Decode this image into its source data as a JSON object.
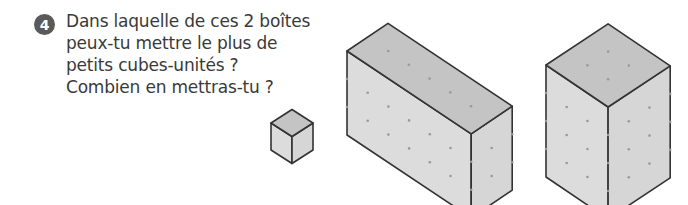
{
  "exercise": {
    "number": "4",
    "question_lines": [
      "Dans laquelle de ces 2 boîtes",
      "peux-tu mettre le plus de",
      "petits cubes-unités ?",
      "Combien en mettras-tu ?"
    ]
  },
  "colors": {
    "badge": "#5a5a5a",
    "text": "#3a3a3a",
    "top_face": "#c4c4c4",
    "front_face": "#dcdcdc",
    "side_face": "#d6d6d6",
    "edge": "#333333",
    "dot": "#9a9a9a"
  },
  "figures": [
    {
      "name": "unit-cube",
      "origin": [
        271,
        123
      ],
      "u": [
        21,
        13.5
      ],
      "v": [
        21,
        -13.5
      ],
      "h": 27,
      "length": 1,
      "depth": 1,
      "height": 1
    },
    {
      "name": "box-1",
      "origin": [
        347,
        51
      ],
      "u": [
        20.7,
        13.8
      ],
      "v": [
        20.5,
        -13.8
      ],
      "h": 28,
      "length": 6,
      "depth": 2,
      "height": 3
    },
    {
      "name": "box-2",
      "origin": [
        546,
        65
      ],
      "u": [
        20.7,
        14
      ],
      "v": [
        20.7,
        -13.7
      ],
      "h": 28,
      "length": 3,
      "depth": 3,
      "height": 4
    }
  ]
}
